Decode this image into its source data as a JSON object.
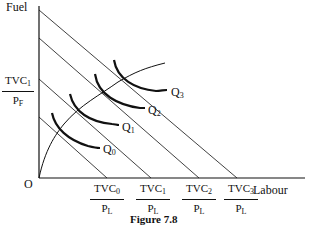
{
  "diagram": {
    "y_axis_label": "Fuel",
    "x_axis_label": "Labour",
    "origin_label": "O",
    "y_intercept_label": {
      "num": "TVC",
      "num_sub": "1",
      "den": "P",
      "den_sub": "F"
    },
    "x_intercept_labels": [
      {
        "num": "TVC",
        "num_sub": "0",
        "den": "P",
        "den_sub": "L"
      },
      {
        "num": "TVC",
        "num_sub": "1",
        "den": "P",
        "den_sub": "L"
      },
      {
        "num": "TVC",
        "num_sub": "2",
        "den": "P",
        "den_sub": "L"
      },
      {
        "num": "TVC",
        "num_sub": "3",
        "den": "P",
        "den_sub": "L"
      }
    ],
    "isoquant_labels": [
      {
        "base": "Q",
        "sub": "0"
      },
      {
        "base": "Q",
        "sub": "1"
      },
      {
        "base": "Q",
        "sub": "2"
      },
      {
        "base": "Q",
        "sub": "3"
      }
    ],
    "caption": "Figure 7.8",
    "colors": {
      "ink": "#111111",
      "background": "#ffffff"
    }
  }
}
